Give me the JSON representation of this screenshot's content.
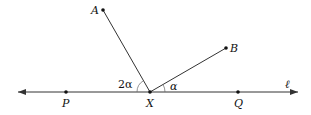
{
  "diagram": {
    "line_label": "ℓ",
    "points": {
      "A": {
        "label": "A",
        "x": 103,
        "y": 10
      },
      "B": {
        "label": "B",
        "x": 226,
        "y": 48
      },
      "X": {
        "label": "X",
        "x": 150,
        "y": 92
      },
      "P": {
        "label": "P",
        "x": 66,
        "y": 92
      },
      "Q": {
        "label": "Q",
        "x": 238,
        "y": 92
      }
    },
    "angles": {
      "AXP": {
        "label": "2α"
      },
      "BXQ": {
        "label": "α"
      }
    },
    "colors": {
      "stroke": "#333333",
      "point": "#111111"
    }
  }
}
